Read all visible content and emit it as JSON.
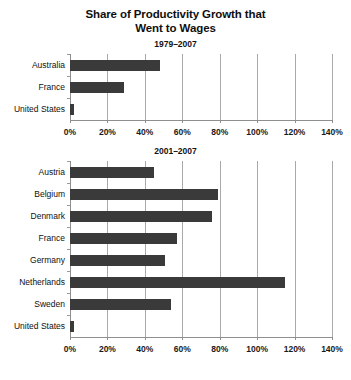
{
  "chart_data": {
    "type": "bar",
    "orientation": "horizontal",
    "title": "Share of Productivity Growth that Went to Wages",
    "title_line1": "Share of Productivity Growth that",
    "title_line2": "Went to Wages",
    "xlabel": "",
    "ylabel": "",
    "xlim": [
      0,
      140
    ],
    "xticks": [
      0,
      20,
      40,
      60,
      80,
      100,
      120,
      140
    ],
    "xtick_labels": [
      "0%",
      "20%",
      "40%",
      "60%",
      "80%",
      "100%",
      "120%",
      "140%"
    ],
    "grid": true,
    "legend": "none",
    "bar_color": "#3a3a3a",
    "units": "percent",
    "panels": [
      {
        "subtitle": "1979–2007",
        "categories": [
          "Australia",
          "France",
          "United States"
        ],
        "values": [
          48,
          29,
          2
        ]
      },
      {
        "subtitle": "2001–2007",
        "categories": [
          "Austria",
          "Belgium",
          "Denmark",
          "France",
          "Germany",
          "Netherlands",
          "Sweden",
          "United States"
        ],
        "values": [
          45,
          79,
          76,
          57,
          51,
          115,
          54,
          2
        ]
      }
    ]
  }
}
